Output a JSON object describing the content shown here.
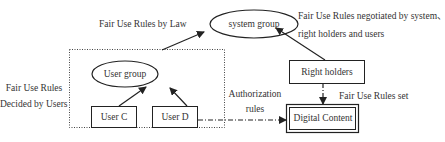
{
  "nodes": {
    "system_group": "system group",
    "user_group": "User group",
    "user_c": "User C",
    "user_d": "User D",
    "right_holders": "Right holders",
    "digital_content": "Digital Content"
  },
  "labels": {
    "law": "Fair Use Rules by Law",
    "negotiated_line1": "Fair Use Rules negotiated by system、",
    "negotiated_line2": "right holders and users",
    "decided_line1": "Fair Use Rules",
    "decided_line2": "Decided by Users",
    "authorization_line1": "Authorization",
    "authorization_line2": "rules",
    "rules_set": "Fair Use Rules set"
  },
  "edges": [
    {
      "from": "user_group",
      "to": "system_group",
      "style": "solid"
    },
    {
      "from": "right_holders",
      "to": "system_group",
      "style": "solid"
    },
    {
      "from": "user_c",
      "to": "user_group",
      "style": "solid"
    },
    {
      "from": "user_d",
      "to": "user_group",
      "style": "solid"
    },
    {
      "from": "right_holders",
      "to": "digital_content",
      "style": "dash-dot"
    },
    {
      "from": "user_d",
      "to": "digital_content",
      "style": "dash-dot"
    }
  ],
  "colors": {
    "line": "#222222",
    "background": "#ffffff"
  }
}
